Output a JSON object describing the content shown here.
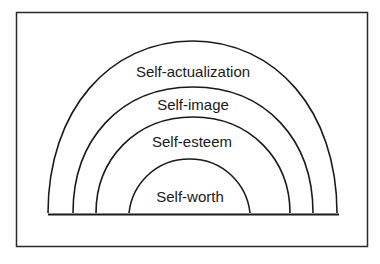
{
  "diagram": {
    "type": "nested-semicircles",
    "layers": [
      {
        "label": "Self-actualization",
        "order": 1
      },
      {
        "label": "Self-image",
        "order": 2
      },
      {
        "label": "Self-esteem",
        "order": 3
      },
      {
        "label": "Self-worth",
        "order": 4
      }
    ],
    "colors": {
      "stroke": "#1a1a1a",
      "background": "#ffffff"
    }
  }
}
